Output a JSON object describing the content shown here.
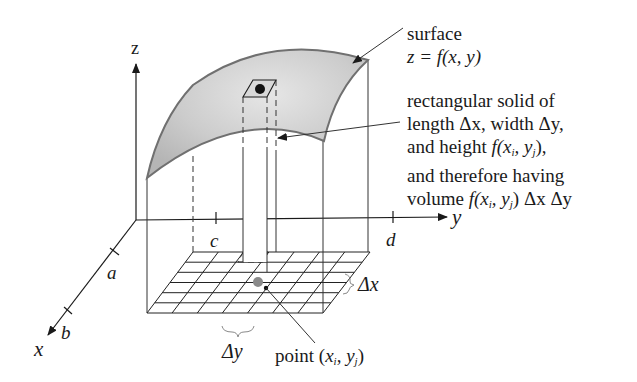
{
  "diagram": {
    "type": "3d-double-integral-illustration",
    "axes": {
      "x_label": "x",
      "y_label": "y",
      "z_label": "z",
      "x_ticks": [
        "a",
        "b"
      ],
      "y_ticks": [
        "c",
        "d"
      ]
    },
    "surface_label": {
      "line1": "surface",
      "line2": "z = f(x, y)"
    },
    "solid_label": {
      "line1": "rectangular solid of",
      "line2": "length Δx, width Δy,",
      "line3_prefix": "and height ",
      "line3_func": "f(x",
      "line3_sub_i": "i",
      "line3_mid": ", y",
      "line3_sub_j": "j",
      "line3_suffix": "),",
      "line4": "and therefore having",
      "line5_prefix": "volume ",
      "line5_func": "f(x",
      "line5_sub_i": "i",
      "line5_mid": ", y",
      "line5_sub_j": "j",
      "line5_suffix": ") Δx Δy"
    },
    "delta_x_label": "Δx",
    "delta_y_label": "Δy",
    "point_label": {
      "prefix": "point (",
      "x": "x",
      "sub_i": "i",
      "sep": ", ",
      "y": "y",
      "sub_j": "j",
      "suffix": ")"
    },
    "colors": {
      "surface_fill": "#c8c8c8",
      "surface_edge": "#707070",
      "point_marker": "#8a8a8a",
      "line": "#1a1a1a"
    }
  }
}
